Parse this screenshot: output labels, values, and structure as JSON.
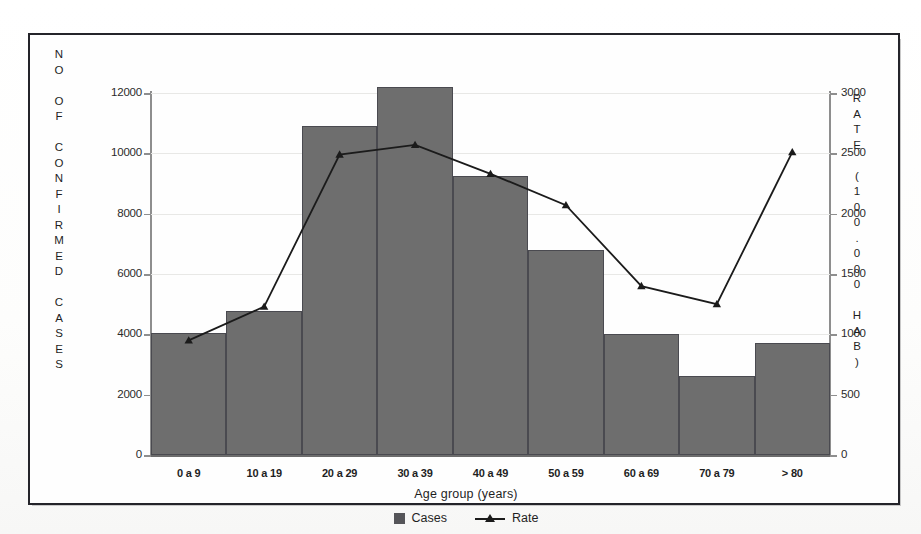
{
  "figure": {
    "border_color": "#24242a",
    "bar_color": "#6e6e6e",
    "line_color": "#1b1b1b"
  },
  "axes": {
    "left_title": "NO OF CONFIRMED CASES",
    "right_title": "RATE (100.000 HAB)",
    "x_title": "Age group (years)",
    "left_ticks": [
      "12000",
      "10000",
      "8000",
      "6000",
      "4000",
      "2000",
      "0"
    ],
    "right_ticks": [
      "3000",
      "2500",
      "2000",
      "1500",
      "1000",
      "500",
      "0"
    ]
  },
  "legend": {
    "items": [
      {
        "label": "Cases",
        "marker": "square-swatch"
      },
      {
        "label": "Rate",
        "marker": "line-triangle-swatch"
      }
    ]
  },
  "chart_data": {
    "type": "bar",
    "title": "",
    "xlabel": "Age group (years)",
    "ylabel": "NO OF CONFIRMED CASES",
    "y2label": "RATE (100.000 HAB)",
    "ylim": [
      0,
      12000
    ],
    "y2lim": [
      0,
      3000
    ],
    "yticks": [
      0,
      2000,
      4000,
      6000,
      8000,
      10000,
      12000
    ],
    "y2ticks": [
      0,
      500,
      1000,
      1500,
      2000,
      2500,
      3000
    ],
    "grid": true,
    "legend_position": "bottom-center",
    "categories": [
      "0 a 9",
      "10 a 19",
      "20 a 29",
      "30 a 39",
      "40 a 49",
      "50 a 59",
      "60 a 69",
      "70 a 79",
      "> 80"
    ],
    "series": [
      {
        "name": "Cases",
        "type": "bar",
        "axis": "left",
        "values": [
          4060,
          4780,
          10900,
          12200,
          9250,
          6800,
          4000,
          2620,
          3700
        ]
      },
      {
        "name": "Rate",
        "type": "line",
        "axis": "right",
        "marker": "triangle",
        "values": [
          950,
          1230,
          2490,
          2570,
          2330,
          2070,
          1400,
          1250,
          2510
        ]
      }
    ]
  }
}
